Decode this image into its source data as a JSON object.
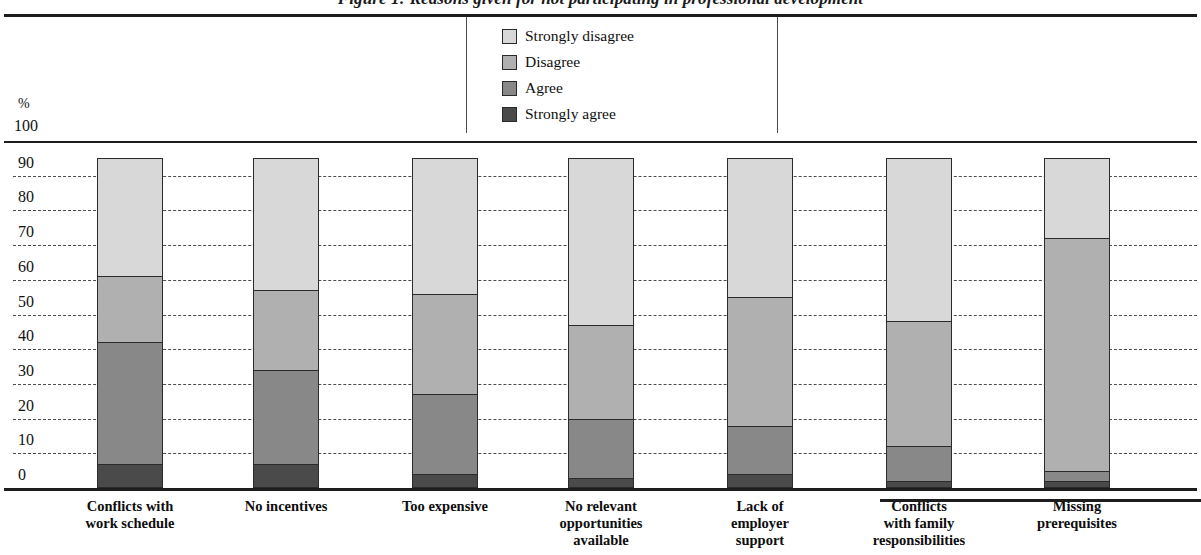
{
  "title": "Figure 1: Reasons given for not participating in professional development",
  "axis": {
    "unit_label": "%",
    "top_label": "100",
    "ticks": [
      "90",
      "80",
      "70",
      "60",
      "50",
      "40",
      "30",
      "20",
      "10",
      "0"
    ]
  },
  "colors": {
    "strongly_disagree": "#d8d8d8",
    "disagree": "#b0b0b0",
    "agree": "#888888",
    "strongly_agree": "#4a4a4a",
    "axis": "#1d1d1d",
    "gridline": "#4c4c4c",
    "background": "#ffffff"
  },
  "legend": {
    "items": [
      {
        "label": "Strongly disagree",
        "color": "#d8d8d8"
      },
      {
        "label": "Disagree",
        "color": "#b0b0b0"
      },
      {
        "label": "Agree",
        "color": "#888888"
      },
      {
        "label": "Strongly agree",
        "color": "#4a4a4a"
      }
    ]
  },
  "chart_data": {
    "type": "bar",
    "subtype": "stacked-vertical",
    "title": "Figure 1: Reasons given for not participating in professional development",
    "xlabel": "",
    "ylabel": "%",
    "ylim": [
      0,
      100
    ],
    "yticks": [
      0,
      10,
      20,
      30,
      40,
      50,
      60,
      70,
      80,
      90,
      100
    ],
    "grid": true,
    "legend_position": "top-center",
    "categories": [
      "Conflicts with\nwork schedule",
      "No incentives",
      "Too expensive",
      "No relevant\nopportunities\navailable",
      "Lack of\nemployer\nsupport",
      "Conflicts\nwith family\nresponsibilities",
      "Missing\nprerequisites"
    ],
    "series": [
      {
        "name": "Strongly agree",
        "color": "#4a4a4a",
        "values": [
          7,
          7,
          4,
          3,
          4,
          2,
          2
        ]
      },
      {
        "name": "Agree",
        "color": "#888888",
        "values": [
          35,
          27,
          23,
          17,
          14,
          10,
          3
        ]
      },
      {
        "name": "Disagree",
        "color": "#b0b0b0",
        "values": [
          19,
          23,
          29,
          27,
          37,
          36,
          67
        ]
      },
      {
        "name": "Strongly disagree",
        "color": "#d8d8d8",
        "values": [
          34,
          38,
          39,
          48,
          40,
          47,
          23
        ]
      }
    ],
    "stack_tops": [
      95,
      95,
      95,
      95,
      95,
      95,
      95
    ]
  },
  "categories_display": [
    {
      "lines": [
        "Conflicts with",
        "work schedule"
      ]
    },
    {
      "lines": [
        "No incentives"
      ]
    },
    {
      "lines": [
        "Too expensive"
      ]
    },
    {
      "lines": [
        "No relevant",
        "opportunities",
        "available"
      ]
    },
    {
      "lines": [
        "Lack of",
        "employer",
        "support"
      ]
    },
    {
      "lines": [
        "Conflicts",
        "with family",
        "responsibilities"
      ]
    },
    {
      "lines": [
        "Missing",
        "prerequisites"
      ]
    }
  ]
}
